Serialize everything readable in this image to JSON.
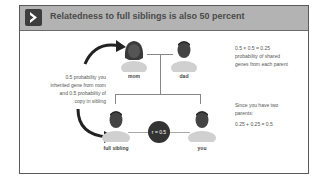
{
  "header": {
    "icon": "chevron-right-icon",
    "title": "Relatedness to full siblings is also 50 percent"
  },
  "left_text": {
    "lines": [
      "0.5 probability you",
      "inherited gene from mom",
      "and 0.5 probability of",
      "copy in sibling"
    ]
  },
  "right_text": {
    "block1": [
      "0.5 × 0.5 = 0.25",
      "probability of shared",
      "genes from each parent"
    ],
    "block2": [
      "Since you have two",
      "parents:",
      "0.25 + 0.25 = 0.5"
    ]
  },
  "people": {
    "mom": "mom",
    "dad": "dad",
    "sibling": "full sibling",
    "you": "you"
  },
  "relatedness_badge": "r = 0.5",
  "colors": {
    "header_bg": "#b3b3b3",
    "frame_border": "#5a5a5a",
    "icon_bg": "#3d3d3d",
    "badge_bg": "#333333"
  }
}
